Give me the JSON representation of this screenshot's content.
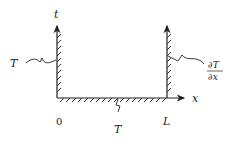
{
  "diagram": {
    "axis_labels": {
      "vertical": "t",
      "horizontal": "x"
    },
    "ticks": {
      "origin": "0",
      "length": "L"
    },
    "boundary_conditions": {
      "left": "T",
      "bottom": "T",
      "right_numerator": "∂T",
      "right_denominator": "∂x"
    },
    "colors": {
      "line": "#222222",
      "background": "#ffffff"
    }
  }
}
